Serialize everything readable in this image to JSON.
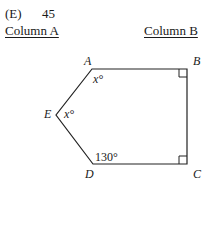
{
  "answer_line": {
    "choice": "(E)",
    "value": "45"
  },
  "columns": {
    "a_label": "Column A",
    "b_label": "Column B"
  },
  "figure": {
    "type": "pentagon",
    "vertices": {
      "A": "A",
      "B": "B",
      "C": "C",
      "D": "D",
      "E": "E"
    },
    "angles": {
      "A": "x°",
      "E": "x°",
      "D": "130°"
    },
    "right_angles": [
      "B",
      "C"
    ]
  }
}
